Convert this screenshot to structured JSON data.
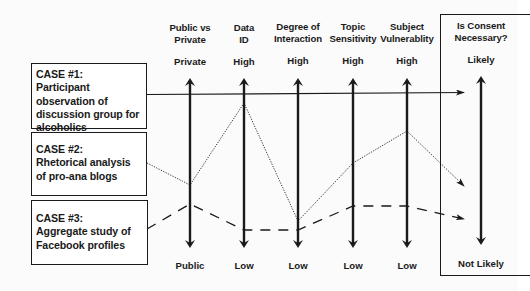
{
  "cases": [
    {
      "title": "CASE #1:",
      "description": "Participant observation of discussion group for alcoholics",
      "line_style": "solid"
    },
    {
      "title": "CASE #2:",
      "description": "Rhetorical analysis of pro-ana blogs",
      "line_style": "dotted"
    },
    {
      "title": "CASE #3:",
      "description": "Aggregate study of Facebook profiles",
      "line_style": "dashed"
    }
  ],
  "axes": [
    {
      "heading_line1": "Public vs",
      "heading_line2": "Private",
      "top": "Private",
      "bottom": "Public"
    },
    {
      "heading_line1": "Data",
      "heading_line2": "ID",
      "top": "High",
      "bottom": "Low"
    },
    {
      "heading_line1": "Degree of",
      "heading_line2": "Interaction",
      "top": "High",
      "bottom": "Low"
    },
    {
      "heading_line1": "Topic",
      "heading_line2": "Sensitivity",
      "top": "High",
      "bottom": "Low"
    },
    {
      "heading_line1": "Subject",
      "heading_line2": "Vulnerablity",
      "top": "High",
      "bottom": "Low"
    }
  ],
  "outcome": {
    "heading_line1": "Is Consent",
    "heading_line2": "Necessary?",
    "top": "Likely",
    "bottom": "Not Likely"
  },
  "colors": {
    "ink": "#1a1a1a",
    "background": "#ffffff"
  }
}
